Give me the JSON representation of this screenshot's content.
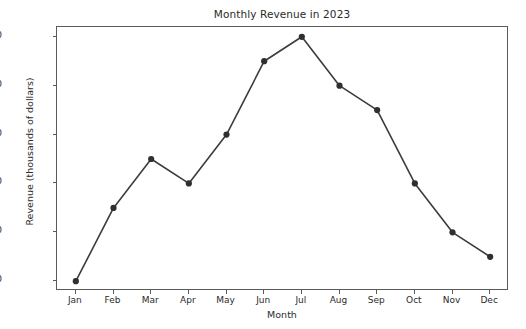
{
  "chart_data": {
    "type": "line",
    "title": "Monthly Revenue in 2023",
    "xlabel": "Month",
    "ylabel": "Revenue (thousands of dollars)",
    "categories": [
      "Jan",
      "Feb",
      "Mar",
      "Apr",
      "May",
      "Jun",
      "Jul",
      "Aug",
      "Sep",
      "Oct",
      "Nov",
      "Dec"
    ],
    "values": [
      50,
      65,
      75,
      70,
      80,
      95,
      100,
      90,
      85,
      70,
      60,
      55
    ],
    "series": [
      {
        "name": "Revenue",
        "values": [
          50,
          65,
          75,
          70,
          80,
          95,
          100,
          90,
          85,
          70,
          60,
          55
        ]
      }
    ],
    "ylim": [
      48,
      102
    ],
    "yticks": [
      50,
      60,
      70,
      80,
      90,
      100
    ],
    "grid": false,
    "legend": false,
    "marker": "circle",
    "line_color": "#3c3c3c",
    "marker_color": "#2f2f2f",
    "background_color": "#ffffff",
    "axes_color": "#5a5a5a"
  }
}
